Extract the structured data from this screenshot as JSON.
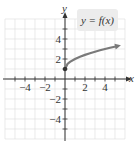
{
  "chart_data": {
    "type": "line",
    "title": "",
    "function_label": "y = f(x)",
    "xlabel": "x",
    "ylabel": "y",
    "xlim": [
      -6,
      6
    ],
    "ylim": [
      -6,
      6
    ],
    "grid": true,
    "x_ticks": [
      -4,
      -2,
      2,
      4
    ],
    "y_ticks": [
      4,
      2,
      -2,
      -4
    ],
    "series": [
      {
        "name": "y = f(x)",
        "start_point": {
          "x": 0,
          "y": 1,
          "filled": true
        },
        "end_arrow": true,
        "x": [
          0,
          0.25,
          0.5,
          1,
          1.5,
          2,
          2.5,
          3,
          3.5,
          4,
          4.5,
          5.3
        ],
        "y": [
          1,
          1.5,
          1.71,
          2,
          2.22,
          2.41,
          2.58,
          2.73,
          2.87,
          3,
          3.12,
          3.3
        ]
      }
    ],
    "colors": {
      "curve": "#7a7a7a",
      "axis": "#333333",
      "grid": "#dcdcdc",
      "label_box": "#ececec"
    }
  }
}
